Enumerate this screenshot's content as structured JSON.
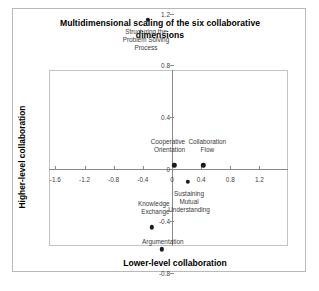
{
  "chart_data": {
    "type": "scatter",
    "title": "Multidimensional scaling of the six collaborative dimensions",
    "xlabel": "Lower-level collaboration",
    "ylabel": "Higher-level collaboration",
    "xlim": [
      -1.6,
      1.2
    ],
    "ylim": [
      -0.8,
      1.2
    ],
    "grid": false,
    "legend": "none",
    "xticks": [
      {
        "value": -1.6,
        "label": "-1.6"
      },
      {
        "value": -1.2,
        "label": "-1.2"
      },
      {
        "value": -0.8,
        "label": "-0.8"
      },
      {
        "value": -0.4,
        "label": "-0.4"
      },
      {
        "value": 0,
        "label": "0"
      },
      {
        "value": 0.4,
        "label": "0.4"
      },
      {
        "value": 0.8,
        "label": "0.8"
      },
      {
        "value": 1.2,
        "label": "1.2"
      }
    ],
    "yticks": [
      {
        "value": 1.2,
        "label": "1.2"
      },
      {
        "value": 0.8,
        "label": "0.8"
      },
      {
        "value": 0.4,
        "label": "0.4"
      },
      {
        "value": 0,
        "label": "0"
      },
      {
        "value": -0.4,
        "label": "-0.4"
      },
      {
        "value": -0.8,
        "label": "-0.8"
      }
    ],
    "points": [
      {
        "label": "Structuring the\nProblem Solving\nProcess",
        "x": -0.33,
        "y": 1.15
      },
      {
        "label": "Cooperative\nOrientation",
        "x": 0.03,
        "y": 0.03
      },
      {
        "label": "Collaboration\nFlow",
        "x": 0.43,
        "y": 0.03
      },
      {
        "label": "Sustaining\nMutual\nUnderstanding",
        "x": 0.22,
        "y": -0.1
      },
      {
        "label": "Knowledge\nExchange",
        "x": -0.28,
        "y": -0.45
      },
      {
        "label": "Argumentation",
        "x": -0.14,
        "y": -0.62
      }
    ],
    "colors": {
      "marker": "#1a1a1a",
      "axis": "#8a8a8a",
      "frame": "#c4c4c4",
      "text": "#000000",
      "label": "#3a3a3a"
    }
  }
}
